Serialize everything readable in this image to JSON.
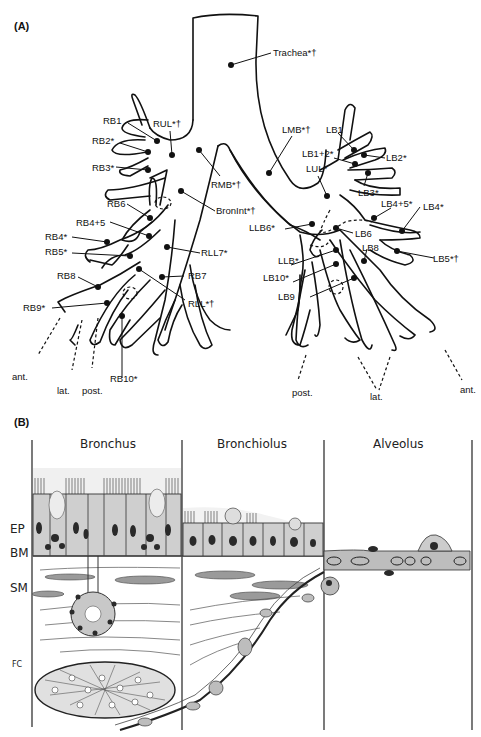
{
  "panel_a": {
    "label": "(A)",
    "right_labels": {
      "trachea": "Trachea*†",
      "rul": "RUL*†",
      "rmb": "RMB*†",
      "bronint": "BronInt*†",
      "rll7": "RLL7*",
      "rb7": "RB7",
      "rll": "RLL*†",
      "rb1": "RB1",
      "rb2": "RB2*",
      "rb3": "RB3*",
      "rb6": "RB6",
      "rb45": "RB4+5",
      "rb4": "RB4*",
      "rb5": "RB5*",
      "rb8": "RB8",
      "rb9": "RB9*",
      "rb10": "RB10*"
    },
    "left_labels": {
      "lmb": "LMB*†",
      "lb1": "LB1",
      "lb12": "LB1+2*",
      "lul": "LUL*",
      "lb2": "LB2*",
      "lb3": "LB3*",
      "lb45": "LB4+5*",
      "lb4": "LB4*",
      "llb6": "LLB6*",
      "lb6": "LB6",
      "lb8": "LB8",
      "llb": "LLB*",
      "lb10": "LB10*",
      "lb9": "LB9",
      "lb5": "LB5*†"
    },
    "orientation_right": {
      "ant": "ant.",
      "lat": "lat.",
      "post": "post."
    },
    "orientation_left": {
      "post": "post.",
      "lat": "lat.",
      "ant": "ant."
    }
  },
  "panel_b": {
    "label": "(B)",
    "columns": [
      "Bronchus",
      "Bronchiolus",
      "Alveolus"
    ],
    "layers": {
      "ep": "EP",
      "bm": "BM",
      "sm": "SM",
      "fc": "FC"
    }
  }
}
